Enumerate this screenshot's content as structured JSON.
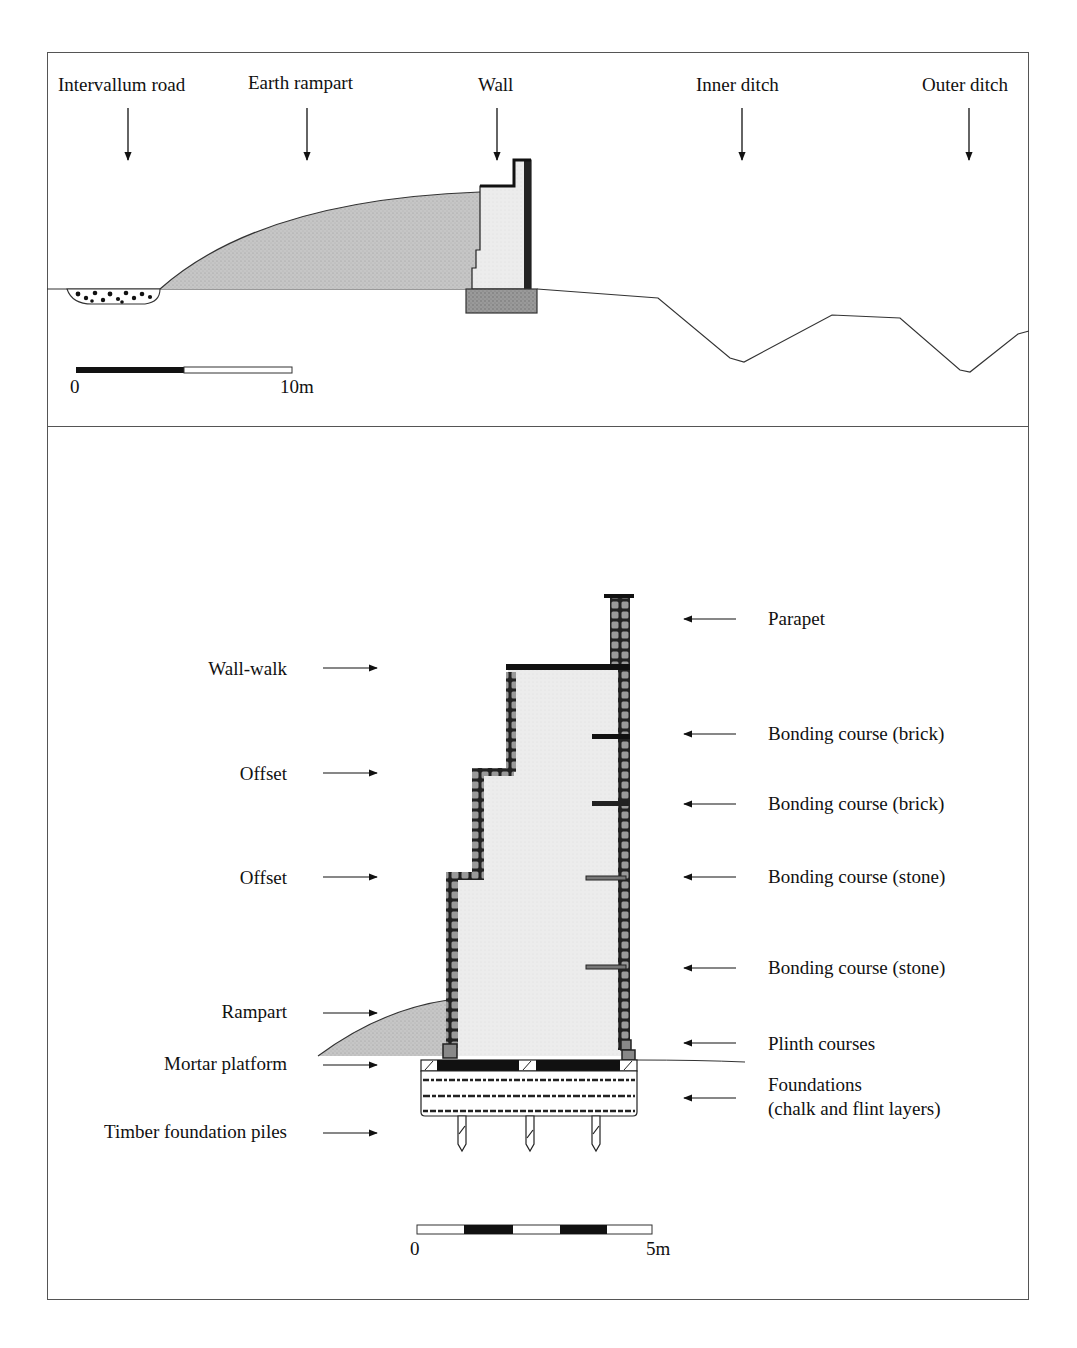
{
  "figure": {
    "top_panel": {
      "title": "Cross-section of town defences",
      "labels": [
        {
          "id": "intervallum-road",
          "text": "Intervallum road"
        },
        {
          "id": "earth-rampart",
          "text": "Earth rampart"
        },
        {
          "id": "wall",
          "text": "Wall"
        },
        {
          "id": "inner-ditch",
          "text": "Inner ditch"
        },
        {
          "id": "outer-ditch",
          "text": "Outer ditch"
        }
      ],
      "scale": {
        "start": "0",
        "end": "10m"
      }
    },
    "bottom_panel": {
      "title": "Detailed wall section",
      "left_labels": [
        {
          "id": "wall-walk",
          "text": "Wall-walk"
        },
        {
          "id": "offset-upper",
          "text": "Offset"
        },
        {
          "id": "offset-lower",
          "text": "Offset"
        },
        {
          "id": "rampart",
          "text": "Rampart"
        },
        {
          "id": "mortar-platform",
          "text": "Mortar platform"
        },
        {
          "id": "timber-piles",
          "text": "Timber foundation piles"
        }
      ],
      "right_labels": [
        {
          "id": "parapet",
          "text": "Parapet"
        },
        {
          "id": "bonding-brick-1",
          "text": "Bonding course (brick)"
        },
        {
          "id": "bonding-brick-2",
          "text": "Bonding course (brick)"
        },
        {
          "id": "bonding-stone-1",
          "text": "Bonding course (stone)"
        },
        {
          "id": "bonding-stone-2",
          "text": "Bonding course (stone)"
        },
        {
          "id": "plinth",
          "text": "Plinth courses"
        },
        {
          "id": "foundations-1",
          "text": "Foundations"
        },
        {
          "id": "foundations-2",
          "text": "(chalk and flint  layers)"
        }
      ],
      "scale": {
        "start": "0",
        "end": "5m"
      }
    },
    "colors": {
      "rampart_fill": "#c8c8c8",
      "wall_core_fill": "#ebebeb",
      "facing_stone": "#8a8a8a",
      "dark": "#111111",
      "foundation_block": "#9a9a9a",
      "frame": "#555555"
    }
  }
}
